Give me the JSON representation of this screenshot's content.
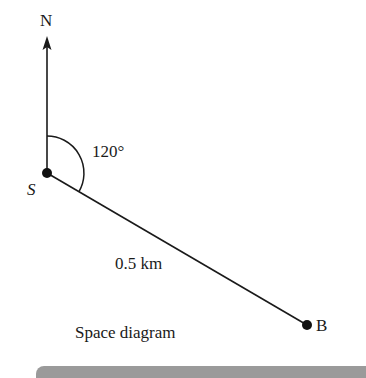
{
  "diagram": {
    "title": "Space diagram",
    "north_label": "N",
    "start_point_label": "S",
    "end_point_label": "B",
    "angle_label": "120°",
    "distance_label": "0.5 km",
    "bearing_degrees": 120,
    "distance_km": 0.5
  },
  "colors": {
    "ink": "#1a1a1a",
    "footer_bar": "#9a9a9a"
  }
}
